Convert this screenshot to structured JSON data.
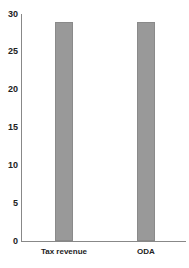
{
  "chart_data": {
    "type": "bar",
    "title": "",
    "xlabel": "",
    "ylabel": "",
    "categories": [
      "Tax revenue",
      "ODA"
    ],
    "values": [
      29,
      29
    ],
    "ylim": [
      0,
      30
    ],
    "yticks": [
      "0",
      "5",
      "10",
      "15",
      "20",
      "25",
      "30"
    ],
    "grid": false,
    "legend": null,
    "bar_color": "#999999"
  }
}
